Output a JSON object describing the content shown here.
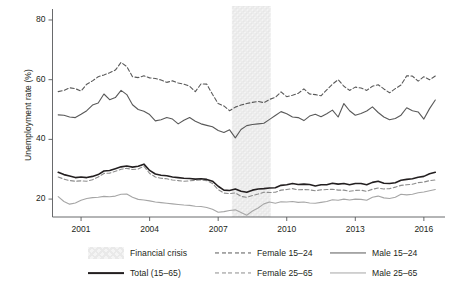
{
  "chart_data": {
    "type": "line",
    "title": "",
    "xlabel": "",
    "ylabel": "Unemployment rate (%)",
    "xlim": [
      1999.75,
      2016.75
    ],
    "ylim": [
      14,
      82
    ],
    "yticks": [
      20,
      40,
      60,
      80
    ],
    "ytick_labels": [
      "20",
      "40",
      "60",
      "80"
    ],
    "xticks": [
      2001,
      2004,
      2007,
      2010,
      2013,
      2016
    ],
    "xtick_labels": [
      "2001",
      "2004",
      "2007",
      "2010",
      "2013",
      "2016"
    ],
    "grid": false,
    "legend_position": "bottom",
    "annotations": [
      {
        "name": "financial-crisis-band",
        "label": "Financial crisis",
        "x_start": 2007.6,
        "x_end": 2009.3,
        "style": "hatched-shaded"
      }
    ],
    "x": [
      2000.0,
      2000.25,
      2000.5,
      2000.75,
      2001.0,
      2001.25,
      2001.5,
      2001.75,
      2002.0,
      2002.25,
      2002.5,
      2002.75,
      2003.0,
      2003.25,
      2003.5,
      2003.75,
      2004.0,
      2004.25,
      2004.5,
      2004.75,
      2005.0,
      2005.25,
      2005.5,
      2005.75,
      2006.0,
      2006.25,
      2006.5,
      2006.75,
      2007.0,
      2007.25,
      2007.5,
      2007.75,
      2008.0,
      2008.25,
      2008.5,
      2008.75,
      2009.0,
      2009.25,
      2009.5,
      2009.75,
      2010.0,
      2010.25,
      2010.5,
      2010.75,
      2011.0,
      2011.25,
      2011.5,
      2011.75,
      2012.0,
      2012.25,
      2012.5,
      2012.75,
      2013.0,
      2013.25,
      2013.5,
      2013.75,
      2014.0,
      2014.25,
      2014.5,
      2014.75,
      2015.0,
      2015.25,
      2015.5,
      2015.75,
      2016.0,
      2016.25,
      2016.5
    ],
    "series": [
      {
        "name": "Female 15-24",
        "style": "dashed",
        "color": "#595959",
        "width": 1.1,
        "values": [
          56.0,
          56.4,
          57.3,
          57.0,
          56.2,
          58.5,
          59.6,
          61.0,
          61.6,
          62.3,
          63.2,
          65.8,
          64.4,
          61.0,
          60.7,
          61.3,
          60.6,
          60.4,
          59.9,
          59.1,
          59.6,
          58.9,
          58.5,
          57.8,
          56.0,
          58.6,
          58.5,
          55.1,
          52.0,
          51.2,
          49.6,
          50.8,
          51.5,
          52.0,
          52.4,
          52.7,
          52.3,
          53.4,
          54.1,
          55.9,
          54.3,
          54.8,
          55.4,
          56.9,
          55.2,
          55.0,
          54.6,
          56.6,
          58.5,
          60.0,
          57.8,
          56.4,
          57.5,
          57.2,
          56.4,
          57.8,
          58.3,
          56.9,
          55.6,
          57.0,
          58.2,
          61.3,
          61.2,
          59.5,
          61.0,
          60.0,
          61.2
        ]
      },
      {
        "name": "Male 15-24",
        "style": "solid",
        "color": "#595959",
        "width": 1.1,
        "values": [
          48.2,
          48.1,
          47.5,
          47.3,
          48.4,
          49.6,
          51.5,
          52.2,
          55.2,
          53.3,
          54.0,
          56.4,
          55.0,
          51.6,
          50.0,
          49.4,
          48.3,
          46.2,
          46.6,
          47.3,
          46.8,
          45.2,
          46.4,
          47.3,
          46.1,
          45.2,
          44.7,
          44.2,
          43.0,
          42.3,
          43.2,
          40.5,
          43.3,
          44.6,
          45.0,
          45.2,
          45.4,
          46.7,
          48.0,
          49.3,
          48.6,
          47.5,
          47.3,
          46.3,
          47.8,
          48.4,
          47.6,
          48.6,
          49.8,
          47.5,
          52.0,
          49.6,
          48.1,
          48.7,
          49.5,
          50.9,
          49.0,
          47.5,
          46.6,
          47.0,
          48.1,
          50.6,
          49.6,
          49.2,
          46.8,
          50.3,
          53.2
        ]
      },
      {
        "name": "Total (15-65)",
        "style": "solid",
        "color": "#231f20",
        "width": 1.6,
        "values": [
          29.0,
          28.2,
          27.7,
          27.2,
          27.4,
          27.2,
          27.6,
          28.2,
          29.4,
          29.6,
          30.2,
          30.8,
          31.1,
          30.7,
          31.0,
          31.7,
          29.6,
          28.4,
          28.0,
          27.8,
          27.4,
          27.2,
          27.0,
          26.9,
          26.7,
          26.8,
          26.6,
          26.0,
          24.3,
          23.0,
          22.9,
          23.4,
          22.6,
          22.3,
          23.0,
          23.4,
          23.5,
          23.7,
          23.8,
          24.6,
          24.8,
          25.2,
          24.9,
          25.0,
          24.9,
          24.4,
          24.8,
          24.8,
          25.3,
          25.0,
          25.2,
          24.8,
          25.2,
          25.2,
          24.8,
          25.6,
          26.0,
          25.3,
          25.2,
          25.5,
          26.3,
          26.6,
          26.8,
          27.3,
          27.6,
          28.5,
          29.0
        ]
      },
      {
        "name": "Female 25-65",
        "style": "dashed",
        "color": "#8c8c8c",
        "width": 1.1,
        "values": [
          27.4,
          26.7,
          26.2,
          26.0,
          26.1,
          26.0,
          26.5,
          27.4,
          28.6,
          28.7,
          29.3,
          30.0,
          30.3,
          29.9,
          30.1,
          31.0,
          28.6,
          27.4,
          27.0,
          26.8,
          26.4,
          26.2,
          26.0,
          26.1,
          26.3,
          26.4,
          26.2,
          25.2,
          23.2,
          22.0,
          21.8,
          22.1,
          20.9,
          20.6,
          21.2,
          21.7,
          22.3,
          22.2,
          22.3,
          23.0,
          23.2,
          23.5,
          23.1,
          23.2,
          23.1,
          22.8,
          23.1,
          23.2,
          23.3,
          23.0,
          23.0,
          22.6,
          22.9,
          23.0,
          22.6,
          23.3,
          23.7,
          23.4,
          23.5,
          24.0,
          24.6,
          24.8,
          25.0,
          25.5,
          25.7,
          26.2,
          26.4
        ]
      },
      {
        "name": "Male 25-65",
        "style": "solid",
        "color": "#a6a6a6",
        "width": 1.1,
        "values": [
          20.8,
          19.2,
          18.3,
          18.7,
          19.6,
          20.2,
          20.5,
          20.6,
          20.9,
          20.8,
          21.0,
          21.6,
          21.7,
          20.6,
          19.9,
          19.7,
          19.4,
          19.0,
          18.8,
          18.6,
          18.4,
          18.2,
          18.0,
          17.9,
          17.6,
          17.5,
          17.2,
          16.6,
          15.6,
          15.8,
          16.2,
          16.4,
          15.5,
          14.6,
          16.0,
          17.0,
          18.4,
          19.0,
          18.6,
          19.1,
          19.0,
          19.2,
          18.9,
          19.0,
          18.7,
          18.6,
          18.9,
          19.2,
          19.8,
          19.6,
          20.0,
          19.7,
          20.0,
          19.9,
          19.6,
          20.6,
          21.0,
          20.4,
          20.2,
          20.6,
          21.6,
          21.4,
          21.6,
          22.1,
          22.4,
          22.8,
          23.2
        ]
      }
    ],
    "legend_entries": [
      {
        "label": "Financial crisis",
        "style": "hatched-shaded",
        "color": "#eeeeee"
      },
      {
        "label": "Female 15–24",
        "style": "dashed",
        "color": "#595959"
      },
      {
        "label": "Male 15–24",
        "style": "solid",
        "color": "#595959"
      },
      {
        "label": "Total (15–65)",
        "style": "solid",
        "color": "#231f20"
      },
      {
        "label": "Female 25–65",
        "style": "dashed",
        "color": "#8c8c8c"
      },
      {
        "label": "Male 25–65",
        "style": "solid",
        "color": "#a6a6a6"
      }
    ]
  }
}
